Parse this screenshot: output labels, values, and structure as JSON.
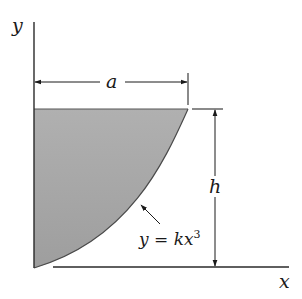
{
  "diagram": {
    "axes": {
      "x_label": "x",
      "y_label": "y"
    },
    "dimensions": {
      "width_label": "a",
      "height_label": "h"
    },
    "curve": {
      "equation_lhs": "y = kx",
      "equation_exp": "3"
    },
    "colors": {
      "fill": "#a9a9a9",
      "stroke": "#333333",
      "line": "#2a2a2a"
    }
  }
}
